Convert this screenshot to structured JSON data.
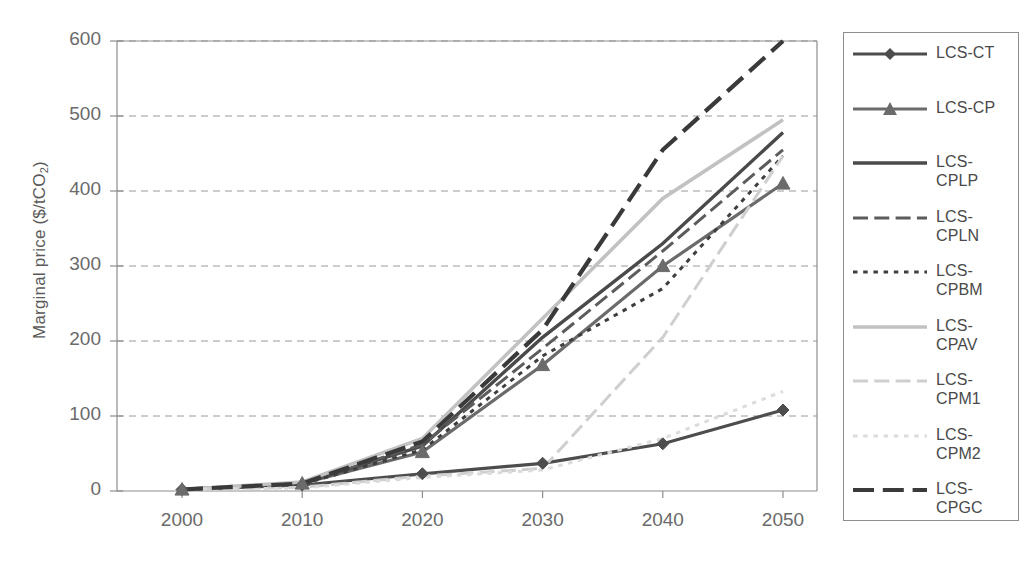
{
  "chart_data": {
    "type": "line",
    "title": "",
    "xlabel": "",
    "ylabel": "Marginal price ($/tCO2)",
    "ylabel_base": "Marginal price ($/tCO",
    "ylabel_sub": "2",
    "ylabel_tail": ")",
    "x": [
      2000,
      2010,
      2020,
      2030,
      2040,
      2050
    ],
    "xtick_labels": [
      "2000",
      "2010",
      "2020",
      "2030",
      "2040",
      "2050"
    ],
    "ytick_labels": [
      "0",
      "100",
      "200",
      "300",
      "400",
      "500",
      "600"
    ],
    "ytick_values": [
      0,
      100,
      200,
      300,
      400,
      500,
      600
    ],
    "xlim": [
      2000,
      2050
    ],
    "ylim": [
      0,
      600
    ],
    "grid": "horizontal-dashed",
    "legend_position": "right-outside",
    "series": [
      {
        "name": "LCS-CT",
        "values": [
          2,
          8,
          23,
          37,
          63,
          108
        ],
        "color": "#4d4d4d",
        "style": "solid",
        "width": 3.2,
        "marker": "diamond"
      },
      {
        "name": "LCS-CP",
        "values": [
          2,
          10,
          52,
          168,
          300,
          410
        ],
        "color": "#6b6b6b",
        "style": "solid",
        "width": 3.2,
        "marker": "triangle"
      },
      {
        "name": "LCS-CPLP",
        "values": [
          2,
          10,
          60,
          205,
          330,
          478
        ],
        "color": "#4a4a4a",
        "style": "solid",
        "width": 3.4,
        "marker": "none"
      },
      {
        "name": "LCS-CPLN",
        "values": [
          2,
          10,
          62,
          190,
          320,
          455
        ],
        "color": "#5c5c5c",
        "style": "longdash",
        "width": 3.0,
        "marker": "none"
      },
      {
        "name": "LCS-CPBM",
        "values": [
          2,
          9,
          55,
          180,
          270,
          447
        ],
        "color": "#3f3f3f",
        "style": "shortdash",
        "width": 3.0,
        "marker": "none"
      },
      {
        "name": "LCS-CPAV",
        "values": [
          2,
          12,
          70,
          230,
          390,
          495
        ],
        "color": "#c2c2c2",
        "style": "solid",
        "width": 3.6,
        "marker": "none"
      },
      {
        "name": "LCS-CPM1",
        "values": [
          2,
          5,
          20,
          30,
          205,
          447
        ],
        "color": "#cfcfcf",
        "style": "longdash",
        "width": 3.0,
        "marker": "none"
      },
      {
        "name": "LCS-CPM2",
        "values": [
          2,
          4,
          18,
          28,
          70,
          133
        ],
        "color": "#dcdcdc",
        "style": "shortdash",
        "width": 3.0,
        "marker": "none"
      },
      {
        "name": "LCS-CPGC",
        "values": [
          2,
          10,
          66,
          215,
          455,
          600
        ],
        "color": "#3a3a3a",
        "style": "longdash",
        "width": 4.2,
        "marker": "none"
      }
    ]
  },
  "legend": {
    "entries": [
      {
        "label": "LCS-CT"
      },
      {
        "label": "LCS-CP"
      },
      {
        "label": "LCS-\nCPLP"
      },
      {
        "label": "LCS-\nCPLN"
      },
      {
        "label": "LCS-\nCPBM"
      },
      {
        "label": "LCS-\nCPAV"
      },
      {
        "label": "LCS-\nCPM1"
      },
      {
        "label": "LCS-\nCPM2"
      },
      {
        "label": "LCS-\nCPGC"
      }
    ]
  },
  "colors": {
    "axis": "#8d8d8d",
    "grid": "#9a9a9a",
    "text": "#5a5a5a",
    "background": "#ffffff"
  }
}
